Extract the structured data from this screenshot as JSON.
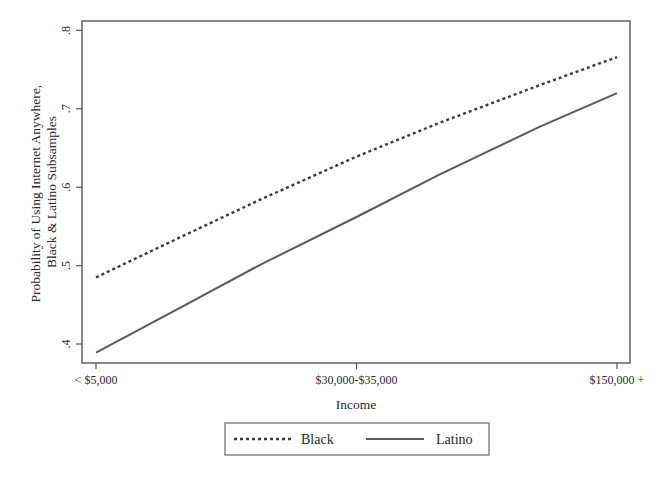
{
  "chart_data": {
    "type": "line",
    "title": "",
    "xlabel": "Income",
    "ylabel": "Probability of Using Internet Anywhere, Black & Latino Subsamples",
    "ylabel_lines": [
      "Probability of Using Internet Anywhere,",
      "Black & Latino Subsamples"
    ],
    "x_tick_labels": [
      "< $5,000",
      "$30,000-$35,000",
      "$150,000 +"
    ],
    "y_ticks": [
      0.4,
      0.5,
      0.6,
      0.7,
      0.8
    ],
    "y_tick_labels": [
      ".4",
      ".5",
      ".6",
      ".7",
      ".8"
    ],
    "ylim": [
      0.388,
      0.814
    ],
    "x_position": [
      0,
      0.161,
      0.315,
      0.5,
      0.659,
      0.851,
      1.0
    ],
    "series": [
      {
        "name": "Black",
        "style": "dotted",
        "color": "#3a3a3a",
        "values": [
          0.485,
          0.536,
          0.584,
          0.639,
          0.682,
          0.73,
          0.766
        ]
      },
      {
        "name": "Latino",
        "style": "solid",
        "color": "#5a5a5a",
        "values": [
          0.389,
          0.446,
          0.501,
          0.562,
          0.616,
          0.677,
          0.72
        ]
      }
    ],
    "grid": false,
    "legend_position": "bottom"
  },
  "legend": {
    "items": [
      {
        "label": "Black",
        "style": "dotted"
      },
      {
        "label": "Latino",
        "style": "solid"
      }
    ]
  }
}
